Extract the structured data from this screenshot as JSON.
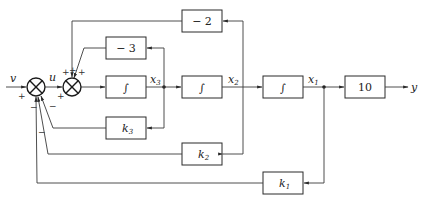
{
  "diagram": {
    "type": "control-system-block-diagram",
    "input_label": "v",
    "output_label": "y",
    "signal_u": "u",
    "states": [
      "x3",
      "x2",
      "x1"
    ],
    "blocks": {
      "neg2": "− 2",
      "neg3": "− 3",
      "int1": "∫",
      "int2": "∫",
      "int3": "∫",
      "gain10": "10",
      "k3": "k",
      "k3_sub": "3",
      "k2": "k",
      "k2_sub": "2",
      "k1": "k",
      "k1_sub": "1"
    },
    "state_labels": {
      "x3": "x",
      "x3_sub": "3",
      "x2": "x",
      "x2_sub": "2",
      "x1": "x",
      "x1_sub": "1"
    },
    "summing_junction_1": {
      "signs": {
        "v_in": "+",
        "top_left": "+",
        "fb": "−",
        "fb2": "−",
        "fb3": "−"
      }
    },
    "summing_junction_2": {
      "signs": {
        "u_in": "+",
        "top1": "+",
        "top2": "+",
        "left": "+"
      }
    },
    "connections": [
      "v -> S1 (+)",
      "S1 -> u -> S2 (+)",
      "S2 -> int1 -> x3",
      "x3 -> int2 -> x2",
      "x2 -> int3 -> x1",
      "x1 -> 10 -> y",
      "x3 -> -3 -> S2 (+)",
      "x2 -> -2 -> S2 (+)",
      "x3 -> k3 -> S1 (−)",
      "x2 -> k2 -> S1 (−)",
      "x1 -> k1 -> S1 (−)"
    ]
  }
}
